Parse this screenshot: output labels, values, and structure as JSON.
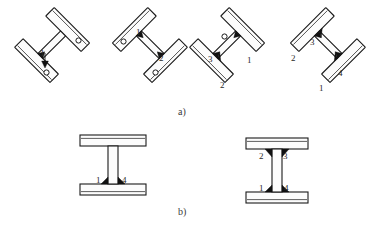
{
  "figure": {
    "panels": [
      {
        "id": "a",
        "caption": "a)",
        "caption_x": 178,
        "caption_y": 112,
        "description": "Four tilted T / I sections shown in successive rotated welding positions",
        "items": [
          {
            "name": "stage-1",
            "rotation_deg": -45,
            "cx": 62,
            "cy": 55,
            "weld_labels": [
              {
                "text": "1",
                "x": 44,
                "y": 51
              }
            ],
            "pivots": 2
          },
          {
            "name": "stage-2",
            "rotation_deg": 45,
            "cx": 140,
            "cy": 55,
            "weld_labels": [
              {
                "text": "1",
                "x": 138,
                "y": 32
              },
              {
                "text": "2",
                "x": 160,
                "y": 58
              }
            ],
            "pivots": 2
          },
          {
            "name": "stage-3",
            "rotation_deg": -45,
            "cx": 237,
            "cy": 55,
            "weld_labels": [
              {
                "text": "1",
                "x": 249,
                "y": 60
              },
              {
                "text": "2",
                "x": 222,
                "y": 85
              },
              {
                "text": "3",
                "x": 211,
                "y": 59
              }
            ],
            "pivots": 1
          },
          {
            "name": "stage-4",
            "rotation_deg": 45,
            "cx": 318,
            "cy": 55,
            "weld_labels": [
              {
                "text": "1",
                "x": 322,
                "y": 88
              },
              {
                "text": "2",
                "x": 294,
                "y": 58
              },
              {
                "text": "3",
                "x": 312,
                "y": 42
              },
              {
                "text": "4",
                "x": 341,
                "y": 73
              }
            ],
            "pivots": 0
          }
        ]
      },
      {
        "id": "b",
        "caption": "b)",
        "caption_x": 178,
        "caption_y": 212,
        "description": "Two upright I-beam cross sections with numbered fillet welds",
        "items": [
          {
            "name": "beam-two-weld",
            "cx": 113,
            "cy": 168,
            "weld_labels": [
              {
                "text": "1",
                "x": 96,
                "y": 186
              },
              {
                "text": "4",
                "x": 122,
                "y": 186
              }
            ],
            "welds": [
              "bottom-left",
              "bottom-right"
            ]
          },
          {
            "name": "beam-four-weld",
            "cx": 275,
            "cy": 168,
            "weld_labels": [
              {
                "text": "2",
                "x": 261,
                "y": 156
              },
              {
                "text": "3",
                "x": 284,
                "y": 156
              },
              {
                "text": "1",
                "x": 258,
                "y": 194
              },
              {
                "text": "4",
                "x": 286,
                "y": 194
              }
            ],
            "welds": [
              "top-left",
              "top-right",
              "bottom-left",
              "bottom-right"
            ]
          }
        ]
      }
    ]
  },
  "colors": {
    "background": "#ffffff",
    "outline": "#1a1a1a",
    "beam_fill": "#fcfcfc",
    "weld_fill": "#111111",
    "label_text": "#2a2a2a",
    "caption_text": "#3a3a3a"
  },
  "labels": {
    "all_numbers": [
      "1",
      "2",
      "3",
      "4"
    ],
    "captions": [
      "a)",
      "b)"
    ]
  }
}
